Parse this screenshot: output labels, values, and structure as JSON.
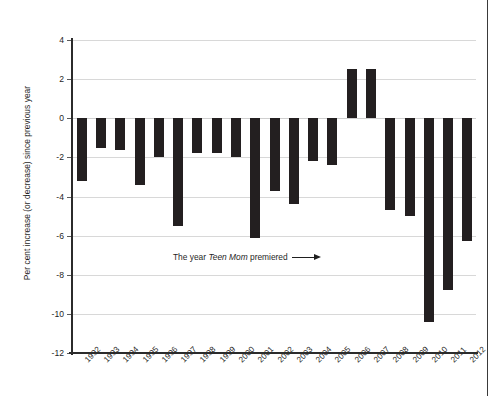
{
  "figure": {
    "right_rule": true,
    "background": "#ffffff",
    "bar_color": "#231f20",
    "gridline_color": "#d8d8d8",
    "axis_color": "#2b2b2b"
  },
  "annotation": {
    "prefix": "The year ",
    "emphasis": "Teen Mom",
    "suffix": " premiered",
    "arrow": "right-arrow",
    "points_to": "2010"
  },
  "chart_data": {
    "type": "bar",
    "title": "",
    "xlabel": "",
    "ylabel": "Per cent increase (or decrease) since previous year",
    "ylim": [
      -12,
      4
    ],
    "yticks": [
      4,
      2,
      0,
      -2,
      -4,
      -6,
      -8,
      -10,
      -12
    ],
    "ytick_labels": [
      "4",
      "2",
      "0",
      "-2",
      "-4",
      "-6",
      "-8",
      "-10",
      "-12"
    ],
    "grid": true,
    "legend": "none",
    "categories": [
      "1992",
      "1993",
      "1994",
      "1995",
      "1996",
      "1997",
      "1998",
      "1999",
      "2000",
      "2001",
      "2002",
      "2003",
      "2004",
      "2005",
      "2006",
      "2007",
      "2008",
      "2009",
      "2010",
      "2011",
      "2012"
    ],
    "values": [
      -3.2,
      -1.5,
      -1.6,
      -3.4,
      -2.0,
      -5.5,
      -1.8,
      -1.8,
      -2.0,
      -6.1,
      -3.7,
      -4.4,
      -2.2,
      -2.4,
      2.5,
      2.5,
      -4.7,
      -5.0,
      -10.4,
      -8.8,
      -6.3
    ]
  }
}
